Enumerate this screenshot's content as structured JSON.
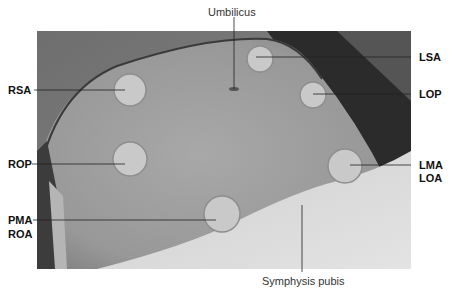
{
  "figure": {
    "labels": {
      "umbilicus": "Umbilicus",
      "symphysis": "Symphysis pubis",
      "rsa": "RSA",
      "rop": "ROP",
      "pma": "PMA",
      "roa": "ROA",
      "lsa": "LSA",
      "lop": "LOP",
      "lma": "LMA",
      "loa": "LOA"
    },
    "colors": {
      "circle_fill": "#c9c9c9",
      "circle_edge": "#8e8e8e",
      "leader_line": "#222222",
      "skin": "#9a9a9a",
      "dark_bg": "#2b2b2b",
      "sheet": "#d8d8d8"
    }
  }
}
